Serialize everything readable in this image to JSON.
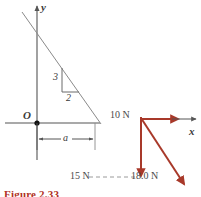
{
  "figure": {
    "caption": "Figure 2.33",
    "axes": {
      "y_label": "y",
      "x_label": "x",
      "origin_label": "O"
    },
    "slope_triangle": {
      "rise_label": "3",
      "run_label": "2"
    },
    "dimension_label": "a",
    "forces": [
      {
        "name": "horizontal-force",
        "label": "10 N",
        "magnitude": 10,
        "unit": "N",
        "direction": "+x"
      },
      {
        "name": "vertical-force",
        "label": "15 N",
        "magnitude": 15,
        "unit": "N",
        "direction": "-y"
      },
      {
        "name": "resultant-force",
        "label": "18.0 N",
        "magnitude": 18.0,
        "unit": "N",
        "direction": "down-right"
      }
    ],
    "colors": {
      "vector": "#a8392a",
      "axis": "#555555",
      "line": "#8a8a8a",
      "caption": "#b03024",
      "text": "#3a3a3a"
    }
  }
}
